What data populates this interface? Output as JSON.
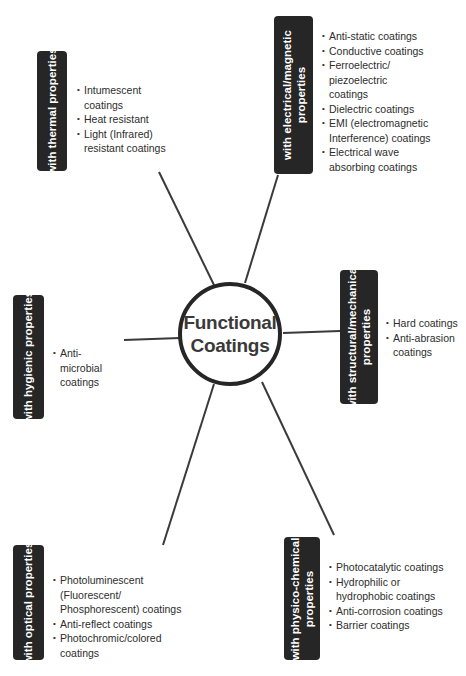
{
  "center": {
    "line1": "Functional",
    "line2": "Coatings"
  },
  "categories": {
    "thermal": {
      "label_lines": [
        "with thermal properties"
      ],
      "items": [
        "Intumescent coatings",
        "Heat resistant",
        "Light (Infrared) resistant coatings"
      ]
    },
    "electrical": {
      "label_lines": [
        "with electrical/magnetic",
        "properties"
      ],
      "items": [
        "Anti-static coatings",
        "Conductive coatings",
        "Ferroelectric/ piezoelectric coatings",
        "Dielectric coatings",
        "EMI (electromagnetic Interference) coatings",
        "Electrical wave absorbing coatings"
      ]
    },
    "hygienic": {
      "label_lines": [
        "with hygienic properties"
      ],
      "items": [
        "Anti-microbial coatings"
      ]
    },
    "structural": {
      "label_lines": [
        "with structural/mechanical",
        "properties"
      ],
      "items": [
        "Hard coatings",
        "Anti-abrasion coatings"
      ]
    },
    "optical": {
      "label_lines": [
        "with optical properties"
      ],
      "items": [
        "Photoluminescent (Fluorescent/ Phosphorescent) coatings",
        "Anti-reflect coatings",
        "Photochromic/colored coatings"
      ]
    },
    "physico_chemical": {
      "label_lines": [
        "with physico-chemical",
        "properties"
      ],
      "items": [
        "Photocatalytic coatings",
        "Hydrophilic or hydrophobic coatings",
        "Anti-corrosion coatings",
        "Barrier coatings"
      ]
    }
  },
  "colors": {
    "box_fill": "#262626",
    "box_text": "#ffffff",
    "line": "#3a3a3a",
    "hub_border": "#262626"
  }
}
